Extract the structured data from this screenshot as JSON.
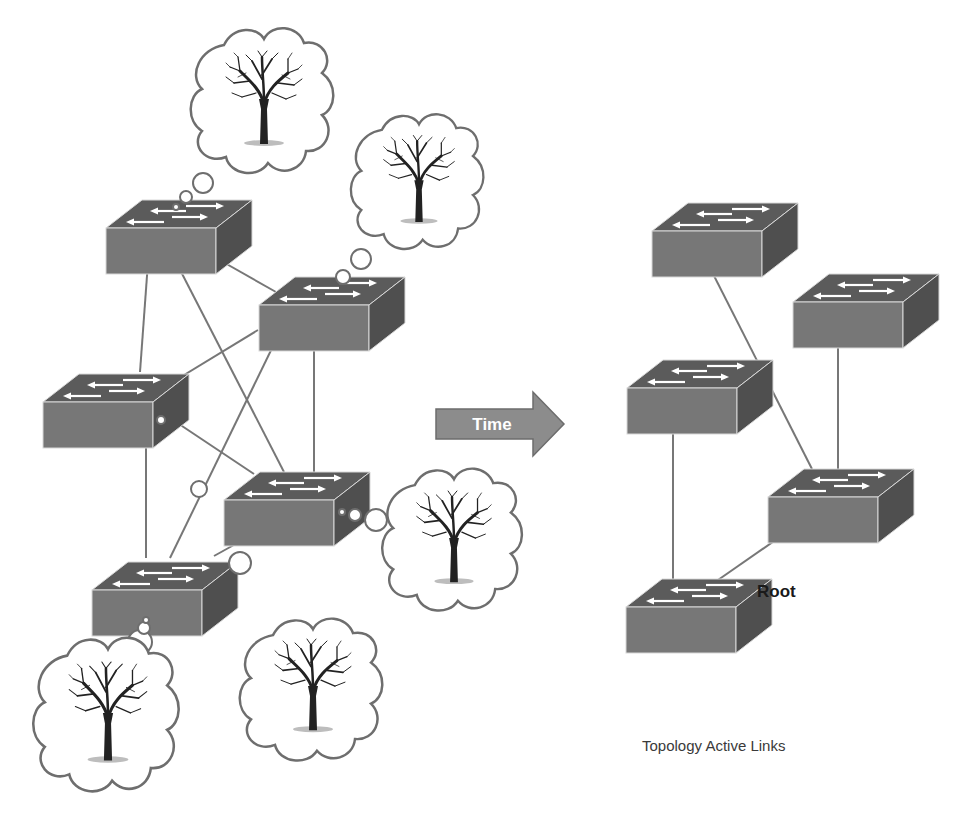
{
  "arrow": {
    "label": "Time",
    "color": "#8c8c8c"
  },
  "root_label": "Root",
  "caption": "Topology Active Links",
  "colors": {
    "switch_top": "#5a5a5a",
    "switch_front": "#767676",
    "switch_side": "#4e4e4e",
    "link": "#777777",
    "cloud_stroke": "#6e6e6e"
  },
  "left_topology": {
    "switches": [
      {
        "id": "L1"
      },
      {
        "id": "L2"
      },
      {
        "id": "L3"
      },
      {
        "id": "L4"
      },
      {
        "id": "L5"
      }
    ],
    "links": [
      [
        "L1",
        "L2"
      ],
      [
        "L1",
        "L3"
      ],
      [
        "L1",
        "L4"
      ],
      [
        "L2",
        "L3"
      ],
      [
        "L2",
        "L4"
      ],
      [
        "L2",
        "L5"
      ],
      [
        "L3",
        "L4"
      ],
      [
        "L3",
        "L5"
      ],
      [
        "L4",
        "L5"
      ]
    ],
    "thought_clouds": [
      {
        "from": "L1",
        "icon": "tree-icon"
      },
      {
        "from": "L2",
        "icon": "tree-icon"
      },
      {
        "from": "L4",
        "icon": "tree-icon"
      },
      {
        "from": "L5",
        "icon": "tree-icon"
      },
      {
        "from": "L3",
        "icon": "tree-icon"
      }
    ]
  },
  "right_topology": {
    "switches": [
      {
        "id": "R1"
      },
      {
        "id": "R2"
      },
      {
        "id": "R3"
      },
      {
        "id": "R4"
      },
      {
        "id": "R5",
        "root": true
      }
    ],
    "links": [
      [
        "R1",
        "R4"
      ],
      [
        "R2",
        "R4"
      ],
      [
        "R3",
        "R5"
      ],
      [
        "R4",
        "R5"
      ]
    ]
  }
}
